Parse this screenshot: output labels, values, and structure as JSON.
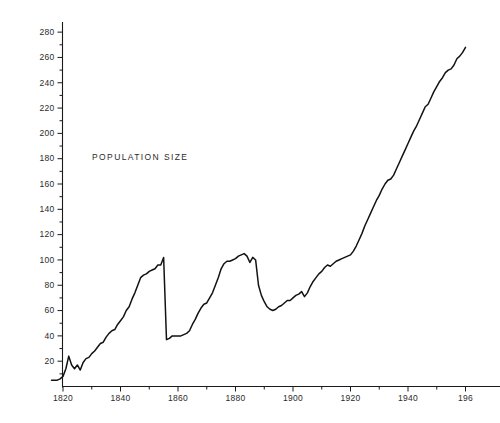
{
  "chart_data": {
    "type": "line",
    "title": "",
    "annotation": "POPULATION  SIZE",
    "xlabel": "",
    "ylabel": "",
    "xlim": [
      1816,
      1961
    ],
    "ylim": [
      0,
      288
    ],
    "grid": false,
    "legend": "none",
    "y_ticks": [
      20,
      40,
      60,
      80,
      100,
      120,
      140,
      160,
      180,
      200,
      220,
      240,
      260,
      280
    ],
    "y_tick_labels": [
      "20",
      "40",
      "60",
      "80",
      "100",
      "120",
      "140",
      "160",
      "180",
      "200",
      "220",
      "240",
      "260",
      "280"
    ],
    "y_minor_ticks": [
      10,
      30,
      50,
      70,
      90,
      110,
      130,
      150,
      170,
      190,
      210,
      230,
      250,
      270
    ],
    "x_ticks": [
      1820,
      1840,
      1860,
      1880,
      1900,
      1920,
      1940,
      1960
    ],
    "x_tick_labels": [
      "1820",
      "1840",
      "1860",
      "1880",
      "1900",
      "1920",
      "1940",
      "196"
    ],
    "x_minor_ticks": [
      1830,
      1850,
      1870,
      1890,
      1910,
      1930,
      1950
    ],
    "line_color": "#121212",
    "series": [
      {
        "name": "POPULATION  SIZE",
        "x": [
          1816,
          1817,
          1818,
          1819,
          1820,
          1821,
          1822,
          1823,
          1824,
          1825,
          1826,
          1827,
          1828,
          1829,
          1830,
          1831,
          1832,
          1833,
          1834,
          1835,
          1836,
          1837,
          1838,
          1839,
          1840,
          1841,
          1842,
          1843,
          1844,
          1845,
          1846,
          1847,
          1848,
          1849,
          1850,
          1851,
          1852,
          1853,
          1854,
          1855,
          1856,
          1857,
          1858,
          1859,
          1860,
          1861,
          1862,
          1863,
          1864,
          1865,
          1866,
          1867,
          1868,
          1869,
          1870,
          1871,
          1872,
          1873,
          1874,
          1875,
          1876,
          1877,
          1878,
          1879,
          1880,
          1881,
          1882,
          1883,
          1884,
          1885,
          1886,
          1887,
          1888,
          1889,
          1890,
          1891,
          1892,
          1893,
          1894,
          1895,
          1896,
          1897,
          1898,
          1899,
          1900,
          1901,
          1902,
          1903,
          1904,
          1905,
          1906,
          1907,
          1908,
          1909,
          1910,
          1911,
          1912,
          1913,
          1914,
          1915,
          1916,
          1917,
          1918,
          1919,
          1920,
          1921,
          1922,
          1923,
          1924,
          1925,
          1926,
          1927,
          1928,
          1929,
          1930,
          1931,
          1932,
          1933,
          1934,
          1935,
          1936,
          1937,
          1938,
          1939,
          1940,
          1941,
          1942,
          1943,
          1944,
          1945,
          1946,
          1947,
          1948,
          1949,
          1950,
          1951,
          1952,
          1953,
          1954,
          1955,
          1956,
          1957,
          1958,
          1959,
          1960
        ],
        "values": [
          5,
          5,
          5,
          6,
          8,
          14,
          24,
          17,
          14,
          17,
          13,
          19,
          22,
          23,
          26,
          28,
          31,
          34,
          35,
          39,
          42,
          44,
          45,
          49,
          52,
          55,
          60,
          63,
          69,
          74,
          80,
          86,
          88,
          89,
          91,
          92,
          93,
          96,
          96,
          102,
          37,
          38,
          40,
          40,
          40,
          40,
          41,
          42,
          44,
          49,
          53,
          58,
          62,
          65,
          66,
          70,
          74,
          80,
          86,
          93,
          97,
          99,
          99,
          100,
          101,
          103,
          104,
          105,
          103,
          98,
          102,
          100,
          80,
          72,
          67,
          63,
          61,
          60,
          61,
          63,
          64,
          66,
          68,
          68,
          70,
          72,
          73,
          75,
          71,
          74,
          79,
          83,
          86,
          89,
          91,
          94,
          96,
          95,
          97,
          99,
          100,
          101,
          102,
          103,
          104,
          107,
          111,
          116,
          121,
          127,
          132,
          137,
          142,
          147,
          151,
          156,
          160,
          163,
          164,
          167,
          172,
          177,
          182,
          187,
          192,
          197,
          202,
          206,
          211,
          216,
          221,
          223,
          228,
          233,
          237,
          241,
          244,
          248,
          250,
          251,
          254,
          259,
          261,
          264,
          268
        ]
      }
    ]
  }
}
